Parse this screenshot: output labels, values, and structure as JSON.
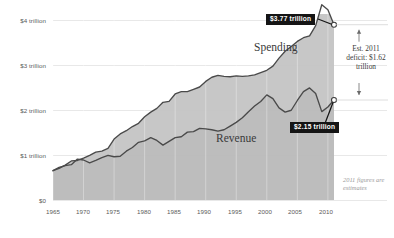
{
  "chart_data": {
    "type": "area",
    "title": "",
    "subtitle": "",
    "xlabel": "",
    "ylabel": "",
    "xlim": [
      1965,
      2011
    ],
    "ylim": [
      0,
      4
    ],
    "grid": true,
    "legend_position": "inline-labels",
    "y_ticks": [
      {
        "value": 0,
        "label": "$0"
      },
      {
        "value": 1,
        "label": "$1 trillion"
      },
      {
        "value": 2,
        "label": "$2 trillion"
      },
      {
        "value": 3,
        "label": "$3 trillion"
      },
      {
        "value": 4,
        "label": "$4 trillion"
      }
    ],
    "x_ticks": [
      {
        "value": 1965,
        "label": "1965"
      },
      {
        "value": 1970,
        "label": "1970"
      },
      {
        "value": 1975,
        "label": "1975"
      },
      {
        "value": 1980,
        "label": "1980"
      },
      {
        "value": 1985,
        "label": "1985"
      },
      {
        "value": 1990,
        "label": "1990"
      },
      {
        "value": 1995,
        "label": "1995"
      },
      {
        "value": 2000,
        "label": "2000"
      },
      {
        "value": 2005,
        "label": "2005"
      },
      {
        "value": 2010,
        "label": "2010"
      }
    ],
    "x": [
      1965,
      1966,
      1967,
      1968,
      1969,
      1970,
      1971,
      1972,
      1973,
      1974,
      1975,
      1976,
      1977,
      1978,
      1979,
      1980,
      1981,
      1982,
      1983,
      1984,
      1985,
      1986,
      1987,
      1988,
      1989,
      1990,
      1991,
      1992,
      1993,
      1994,
      1995,
      1996,
      1997,
      1998,
      1999,
      2000,
      2001,
      2002,
      2003,
      2004,
      2005,
      2006,
      2007,
      2008,
      2009,
      2010,
      2011
    ],
    "series": [
      {
        "name": "Spending",
        "color": "#4a4a4a",
        "values": [
          0.63,
          0.68,
          0.75,
          0.84,
          0.85,
          0.9,
          0.96,
          1.03,
          1.05,
          1.11,
          1.31,
          1.42,
          1.49,
          1.58,
          1.65,
          1.79,
          1.89,
          1.97,
          2.1,
          2.12,
          2.28,
          2.33,
          2.33,
          2.38,
          2.43,
          2.55,
          2.64,
          2.68,
          2.66,
          2.65,
          2.67,
          2.66,
          2.67,
          2.69,
          2.74,
          2.79,
          2.88,
          3.05,
          3.2,
          3.3,
          3.41,
          3.49,
          3.53,
          3.75,
          4.2,
          4.09,
          3.77
        ]
      },
      {
        "name": "Revenue",
        "color": "#4a4a4a",
        "values": [
          0.63,
          0.7,
          0.74,
          0.76,
          0.88,
          0.86,
          0.8,
          0.85,
          0.91,
          0.96,
          0.93,
          0.94,
          1.05,
          1.13,
          1.24,
          1.27,
          1.34,
          1.28,
          1.18,
          1.26,
          1.34,
          1.36,
          1.46,
          1.47,
          1.54,
          1.53,
          1.51,
          1.48,
          1.51,
          1.59,
          1.67,
          1.77,
          1.9,
          2.02,
          2.12,
          2.26,
          2.18,
          1.98,
          1.89,
          1.93,
          2.14,
          2.33,
          2.41,
          2.29,
          1.9,
          2.0,
          2.15
        ]
      }
    ],
    "annotations": [
      {
        "name": "spending-endpoint-callout",
        "text": "$3.77 trillion",
        "x": 2011,
        "y": 3.77
      },
      {
        "name": "revenue-endpoint-callout",
        "text": "$2.15 trillion",
        "x": 2011,
        "y": 2.15
      },
      {
        "name": "deficit-note",
        "text": "Est. 2011 deficit: $1.62 trillion",
        "value": 1.62
      },
      {
        "name": "estimates-footnote",
        "text": "2011 figures are estimates"
      }
    ]
  },
  "labels": {
    "spending": "Spending",
    "revenue": "Revenue",
    "callout_spending": "$3.77 trillion",
    "callout_revenue": "$2.15 trillion",
    "deficit_note": "Est. 2011 deficit: $1.62 trillion",
    "footnote": "2011 figures are estimates"
  },
  "y_axis": {
    "t0": "$0",
    "t1": "$1 trillion",
    "t2": "$2 trillion",
    "t3": "$3 trillion",
    "t4": "$4 trillion"
  },
  "x_axis": {
    "t1965": "1965",
    "t1970": "1970",
    "t1975": "1975",
    "t1980": "1980",
    "t1985": "1985",
    "t1990": "1990",
    "t1995": "1995",
    "t2000": "2000",
    "t2005": "2005",
    "t2010": "2010"
  },
  "colors": {
    "line": "#4a4a4a",
    "fill": "#c9c9c9",
    "grid": "#dddddd",
    "callout_bg": "#151515",
    "callout_text": "#ffffff",
    "tick_text": "#5a5a5a",
    "footnote_text": "#9a9a9a"
  }
}
